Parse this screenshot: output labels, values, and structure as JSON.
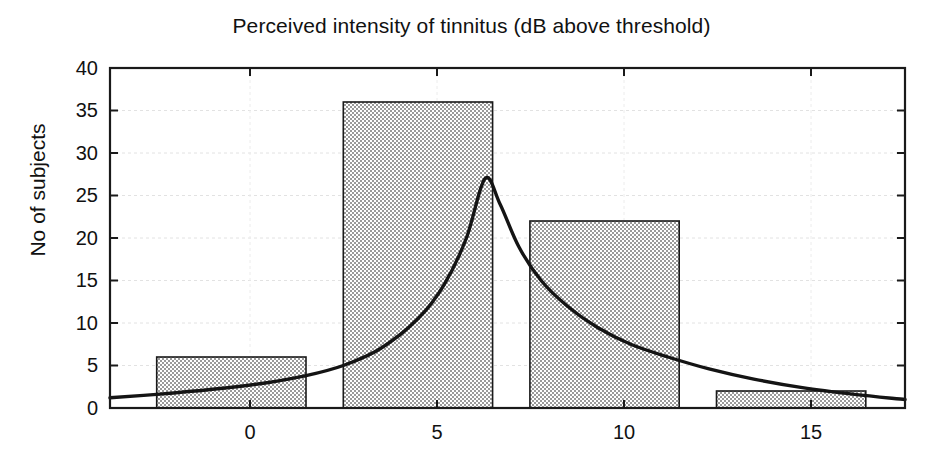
{
  "chart_data": {
    "type": "bar",
    "title": "Perceived intensity of tinnitus (dB above threshold)",
    "xlabel": "",
    "ylabel": "No of subjects",
    "xlim": [
      -3.75,
      17.55
    ],
    "ylim": [
      0,
      40
    ],
    "grid": true,
    "legend": null,
    "annotations": [
      {
        "text": "N = 66 ears",
        "boxed": true,
        "x": 13.4,
        "y": 36
      }
    ],
    "xticks": [
      0,
      5,
      10,
      15
    ],
    "xtick_labels": [
      "0",
      "5",
      "10",
      "15"
    ],
    "yticks": [
      0,
      5,
      10,
      15,
      20,
      25,
      30,
      35,
      40
    ],
    "ytick_labels": [
      "0",
      "5",
      "10",
      "15",
      "20",
      "25",
      "30",
      "35",
      "40"
    ],
    "bin_width": 4,
    "bars": [
      {
        "label": "-2.5",
        "bin_start": -2.5,
        "bin_end": 1.5,
        "value": 6
      },
      {
        "label": "2.5",
        "bin_start": 2.5,
        "bin_end": 6.5,
        "value": 36
      },
      {
        "label": "7.5",
        "bin_start": 7.5,
        "bin_end": 11.5,
        "value": 22
      },
      {
        "label": "12.5",
        "bin_start": 12.5,
        "bin_end": 16.5,
        "value": 2
      }
    ],
    "categories": [
      "-2.5 to 1.5",
      "2.5 to 6.5",
      "7.5 to 11.5",
      "12.5 to 16.5"
    ],
    "values": [
      6,
      36,
      22,
      2
    ],
    "overlay_curve": {
      "name": "fitted distribution",
      "x": [
        -3.75,
        -2.5,
        -1.0,
        0.5,
        1.5,
        2.5,
        3.5,
        4.5,
        5.2,
        5.8,
        6.3,
        6.7,
        7.2,
        7.8,
        8.5,
        9.3,
        10.2,
        11.2,
        12.3,
        13.5,
        14.8,
        16.2,
        17.55
      ],
      "y": [
        1.2,
        1.6,
        2.2,
        3.0,
        3.8,
        5.0,
        7.0,
        10.5,
        14.5,
        20.0,
        27.0,
        24.0,
        19.0,
        15.0,
        12.0,
        9.5,
        7.5,
        6.0,
        4.6,
        3.4,
        2.4,
        1.6,
        1.0
      ]
    },
    "style": {
      "bar_fill": "#d9d9d9",
      "bar_pattern": "dotted",
      "bar_edge": "#1a1a1a",
      "curve_color": "#111111",
      "axis_color": "#1a1a1a",
      "grid_color": "#dedede",
      "background": "#ffffff"
    }
  }
}
